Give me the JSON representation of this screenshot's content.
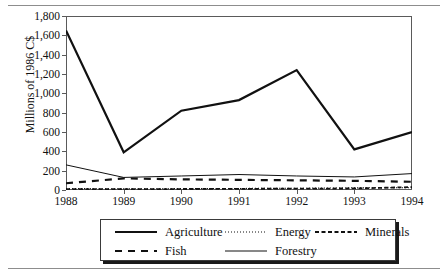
{
  "figure": {
    "top_rule": "hairline-rule",
    "bottom_rule": "hairline-rule"
  },
  "chart_data": {
    "type": "line",
    "title": "",
    "xlabel": "",
    "ylabel": "Millions of 1986 C$",
    "categories": [
      "1988",
      "1989",
      "1990",
      "1991",
      "1992",
      "1993",
      "1994"
    ],
    "x": [
      1988,
      1989,
      1990,
      1991,
      1992,
      1993,
      1994
    ],
    "ylim": [
      0,
      1800
    ],
    "yticks": [
      0,
      200,
      400,
      600,
      800,
      1000,
      1200,
      1400,
      1600,
      1800
    ],
    "ytick_labels": [
      "0",
      "200",
      "400",
      "600",
      "800",
      "1,000",
      "1,200",
      "1,400",
      "1,600",
      "1,800"
    ],
    "grid": false,
    "legend_position": "bottom-center",
    "series": [
      {
        "name": "Agriculture",
        "style": "solid-thick",
        "color": "#111111",
        "values": [
          1650,
          390,
          820,
          930,
          1240,
          420,
          600
        ]
      },
      {
        "name": "Energy",
        "style": "dotted",
        "color": "#111111",
        "values": [
          15,
          12,
          14,
          16,
          18,
          22,
          24
        ]
      },
      {
        "name": "Minerals",
        "style": "dashed-coarse",
        "color": "#111111",
        "values": [
          10,
          8,
          10,
          12,
          14,
          16,
          30
        ]
      },
      {
        "name": "Fish",
        "style": "dashed",
        "color": "#111111",
        "values": [
          70,
          120,
          110,
          105,
          100,
          95,
          85
        ]
      },
      {
        "name": "Forestry",
        "style": "solid-thin",
        "color": "#111111",
        "values": [
          260,
          130,
          145,
          160,
          145,
          135,
          170
        ]
      }
    ]
  },
  "legend": {
    "items": [
      {
        "label": "Agriculture",
        "swatch": "solid-thick-swatch"
      },
      {
        "label": "Energy",
        "swatch": "dotted-swatch"
      },
      {
        "label": "Minerals",
        "swatch": "dashed-coarse-swatch"
      },
      {
        "label": "Fish",
        "swatch": "dashed-swatch"
      },
      {
        "label": "Forestry",
        "swatch": "solid-thin-swatch"
      }
    ]
  }
}
